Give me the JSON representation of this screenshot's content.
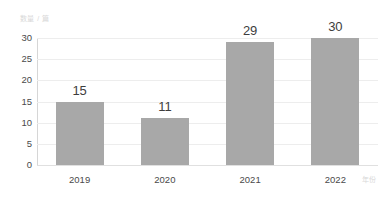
{
  "chart_data": {
    "type": "bar",
    "title": "",
    "subtitle": "",
    "xlabel": "年份",
    "ylabel": "数量 / 篇",
    "categories": [
      "2019",
      "2020",
      "2021",
      "2022"
    ],
    "values": [
      15,
      11,
      29,
      30
    ],
    "data_labels": [
      "15",
      "11",
      "29",
      "30"
    ],
    "ylim": [
      0,
      30
    ],
    "y_ticks": [
      0,
      5,
      10,
      15,
      20,
      25,
      30
    ],
    "y_tick_labels": [
      "0",
      "5",
      "10",
      "15",
      "20",
      "25",
      "30"
    ],
    "grid": true,
    "grid_axis": "y",
    "legend": false,
    "legend_position": "none",
    "series": [
      {
        "name": "数量",
        "values": [
          15,
          11,
          29,
          30
        ]
      }
    ],
    "colors": {
      "bar": "#a8a8a8",
      "gridline": "#ededed",
      "axis_line": "#d6d6d6",
      "tick_text": "#4a4a4a",
      "value_text": "#3d3d3d",
      "axis_title_text": "#d8d8d8",
      "background": "#ffffff"
    }
  }
}
